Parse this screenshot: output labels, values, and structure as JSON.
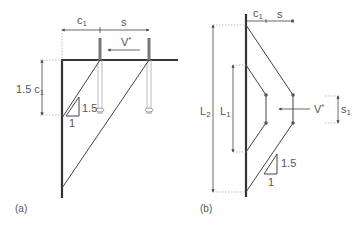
{
  "figure_a": {
    "caption": "(a)",
    "dim_c1": {
      "main": "c",
      "sub": "1"
    },
    "dim_s": "s",
    "load": {
      "main": "V",
      "sup": "*"
    },
    "height_dim": {
      "prefix": "1.5 ",
      "main": "c",
      "sub": "1"
    },
    "slope": {
      "rise": "1.5",
      "run": "1"
    }
  },
  "figure_b": {
    "caption": "(b)",
    "dim_c1": {
      "main": "c",
      "sub": "1"
    },
    "dim_s": "s",
    "dim_L1": {
      "main": "L",
      "sub": "1"
    },
    "dim_L2": {
      "main": "L",
      "sub": "2"
    },
    "dim_s1": {
      "main": "s",
      "sub": "1"
    },
    "load": {
      "main": "V",
      "sup": "*"
    },
    "slope": {
      "rise": "1.5",
      "run": "1"
    }
  },
  "colors": {
    "member": "#333333",
    "line": "#444444",
    "anchor": "#777777",
    "dashed": "#888888",
    "text": "#555555"
  }
}
